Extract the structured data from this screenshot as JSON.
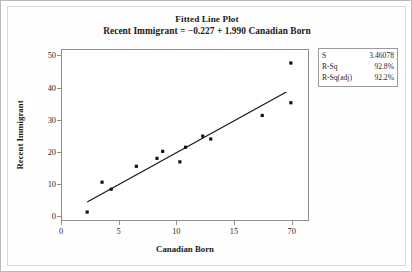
{
  "chart_data": {
    "type": "scatter",
    "title": "Fitted Line Plot",
    "subtitle": "Recent Immigrant = −0.227 + 1.990 Canadian Born",
    "xlabel": "Canadian Born",
    "ylabel": "Recent Immigrant",
    "xlim": [
      0,
      21.5
    ],
    "ylim": [
      -1.5,
      52
    ],
    "grid": false,
    "legend_position": "top-right-outside",
    "x_ticks": [
      "0",
      "5",
      "10",
      "15",
      "70"
    ],
    "x_tick_values": [
      0,
      5,
      10,
      15,
      20
    ],
    "y_ticks": [
      "0",
      "10",
      "20",
      "30",
      "40",
      "50"
    ],
    "y_tick_values": [
      0,
      10,
      20,
      30,
      40,
      50
    ],
    "points": [
      {
        "x": 2.2,
        "y": 1.0
      },
      {
        "x": 3.5,
        "y": 10.4
      },
      {
        "x": 4.3,
        "y": 8.2
      },
      {
        "x": 6.5,
        "y": 15.4
      },
      {
        "x": 8.3,
        "y": 17.9
      },
      {
        "x": 8.8,
        "y": 20.1
      },
      {
        "x": 10.3,
        "y": 16.8
      },
      {
        "x": 10.8,
        "y": 21.4
      },
      {
        "x": 12.3,
        "y": 24.9
      },
      {
        "x": 13.0,
        "y": 24.0
      },
      {
        "x": 17.5,
        "y": 31.4
      },
      {
        "x": 20.0,
        "y": 35.4
      },
      {
        "x": 20.0,
        "y": 47.9
      }
    ],
    "fit_line": {
      "intercept": -0.227,
      "slope": 1.99,
      "x_start": 2.2,
      "x_end": 19.6
    },
    "series_name": "Recent Immigrant vs Canadian Born"
  },
  "stats": {
    "rows": [
      {
        "key": "S",
        "value": "3.46078"
      },
      {
        "key": "R-Sq",
        "value": "92.8%"
      },
      {
        "key": "R-Sq(adj)",
        "value": "92.2%"
      }
    ]
  },
  "colors": {
    "point": "#111111",
    "line": "#1a1a1a",
    "axis": "#8e8e8e",
    "text": "#1b1b1b",
    "box_border": "#9a9a9a",
    "outer_border": "#b9b9b9"
  }
}
